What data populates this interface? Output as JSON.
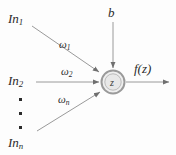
{
  "diagram": {
    "type": "neural-network-neuron",
    "background_color": "#fdfdfd",
    "stroke_color": "#8a8a8a",
    "text_color": "#2b2b2b",
    "node": {
      "label": "z",
      "outer_ring_color": "#9a9a9a",
      "fill_color": "#ececec",
      "center_x": 113,
      "center_y": 82,
      "radius": 12
    },
    "inputs": [
      {
        "label_html": "In<sub>1</sub>",
        "weight_html": "&omega;<sub>1</sub>"
      },
      {
        "label_html": "In<sub>2</sub>",
        "weight_html": "&omega;<sub>2</sub>"
      },
      {
        "label_html": "In<sub>n</sub>",
        "weight_html": "&omega;<sub>n</sub>"
      }
    ],
    "bias": {
      "label_html": "b"
    },
    "output": {
      "label_html": "f(z)"
    },
    "ellipsis": {
      "dot_count": 3,
      "dot_color": "#2b2b2b"
    }
  }
}
